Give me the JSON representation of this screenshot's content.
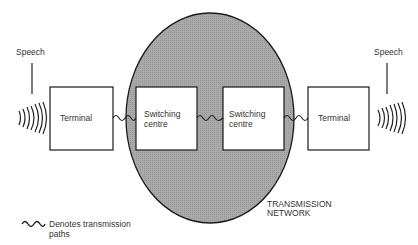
{
  "diagram": {
    "type": "telephone-network-block-diagram",
    "colors": {
      "network_fill": "#a8a8a8",
      "outline": "#1a1a1a",
      "box_fill": "#ffffff",
      "text": "#333333"
    },
    "speech_left": {
      "label": "Speech",
      "icon": "sound-waves-icon"
    },
    "speech_right": {
      "label": "Speech",
      "icon": "sound-waves-icon"
    },
    "nodes": [
      {
        "id": "terminal-left",
        "label": "Terminal"
      },
      {
        "id": "switching-centre-1",
        "label_line1": "Switching",
        "label_line2": "centre"
      },
      {
        "id": "switching-centre-2",
        "label_line1": "Switching",
        "label_line2": "centre"
      },
      {
        "id": "terminal-right",
        "label": "Terminal"
      }
    ],
    "links": [
      {
        "from": "terminal-left",
        "to": "switching-centre-1",
        "style": "wavy"
      },
      {
        "from": "switching-centre-1",
        "to": "switching-centre-2",
        "style": "wavy"
      },
      {
        "from": "switching-centre-2",
        "to": "terminal-right",
        "style": "wavy"
      }
    ],
    "network": {
      "label_line1": "TRANSMISSION",
      "label_line2": "NETWORK"
    },
    "legend": {
      "icon": "wavy-line-icon",
      "text_line1": "Denotes transmission",
      "text_line2": "paths"
    }
  }
}
